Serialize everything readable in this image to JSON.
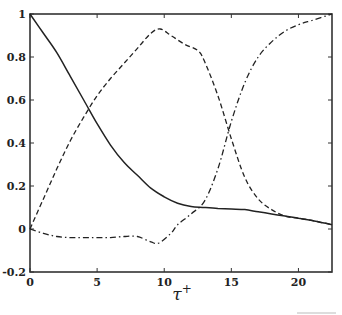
{
  "chart_data": {
    "type": "line",
    "title": "",
    "xlabel": "τ+",
    "xlabel_main": "τ",
    "xlabel_sup": "+",
    "ylabel": "",
    "xlim": [
      0,
      22.5
    ],
    "ylim": [
      -0.2,
      1.0
    ],
    "xticks": [
      0,
      5,
      10,
      15,
      20
    ],
    "xtick_labels": [
      "0",
      "5",
      "10",
      "15",
      "20"
    ],
    "yticks": [
      -0.2,
      0,
      0.2,
      0.4,
      0.6,
      0.8,
      1.0
    ],
    "ytick_labels": [
      "-0.2",
      "0",
      "0.2",
      "0.4",
      "0.6",
      "0.8",
      "1"
    ],
    "grid": false,
    "legend": null,
    "series": [
      {
        "name": "solid",
        "style": "solid",
        "x": [
          0,
          1,
          2,
          3,
          4,
          5,
          6,
          7,
          8,
          9,
          10,
          11,
          12,
          13,
          14,
          15,
          16,
          17,
          18,
          19,
          20,
          21,
          22.5
        ],
        "values": [
          1.0,
          0.91,
          0.82,
          0.71,
          0.6,
          0.49,
          0.39,
          0.31,
          0.25,
          0.19,
          0.15,
          0.12,
          0.105,
          0.1,
          0.095,
          0.093,
          0.09,
          0.08,
          0.07,
          0.06,
          0.05,
          0.04,
          0.02
        ]
      },
      {
        "name": "dashed",
        "style": "dashed",
        "x": [
          0,
          1,
          2,
          3,
          4,
          5,
          6,
          7,
          8,
          9,
          9.7,
          10.5,
          11.5,
          12.5,
          13,
          14,
          15,
          16,
          17,
          18,
          19,
          20,
          21,
          22.5
        ],
        "values": [
          0.0,
          0.14,
          0.28,
          0.41,
          0.52,
          0.62,
          0.7,
          0.77,
          0.84,
          0.91,
          0.93,
          0.9,
          0.86,
          0.83,
          0.78,
          0.62,
          0.42,
          0.24,
          0.14,
          0.09,
          0.06,
          0.05,
          0.04,
          0.02
        ]
      },
      {
        "name": "dash-dot",
        "style": "dashdot",
        "x": [
          0,
          1,
          2,
          3,
          4,
          5,
          6,
          7,
          8,
          9,
          9.6,
          10.5,
          11,
          12,
          13,
          14,
          15,
          16,
          17,
          18,
          19,
          20,
          21,
          22.5
        ],
        "values": [
          0.0,
          -0.02,
          -0.035,
          -0.04,
          -0.04,
          -0.04,
          -0.04,
          -0.035,
          -0.035,
          -0.06,
          -0.065,
          -0.02,
          0.02,
          0.07,
          0.13,
          0.28,
          0.5,
          0.68,
          0.8,
          0.87,
          0.92,
          0.95,
          0.97,
          1.0
        ]
      }
    ]
  }
}
